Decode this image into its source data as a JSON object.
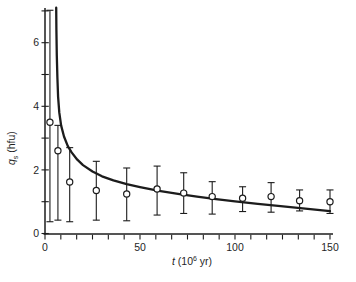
{
  "figure": {
    "background_color": "#ffffff",
    "ink_color": "#1c1c1c",
    "x_axis": {
      "tick_labels": [
        "0",
        "50",
        "100",
        "150"
      ],
      "label_parts": {
        "variable": "t",
        "open": " (10",
        "superscript": "6",
        "close": " yr)"
      }
    },
    "y_axis": {
      "tick_labels": [
        "0",
        "2",
        "4",
        "6"
      ],
      "label_parts": {
        "variable": "q",
        "subscript": "s",
        "rest": " (hfu)"
      }
    }
  },
  "chart_data": {
    "type": "scatter",
    "title": "",
    "xlabel": "t (10^6 yr)",
    "ylabel": "q_s (hfu)",
    "xlim": [
      0,
      154
    ],
    "ylim": [
      0,
      7.1
    ],
    "x_major_ticks": [
      0,
      50,
      100,
      150
    ],
    "x_minor_tick_step": 8.333,
    "y_labeled_ticks": [
      0,
      2,
      4,
      6
    ],
    "y_minor_ticks": [
      1,
      3,
      5,
      7
    ],
    "grid": false,
    "legend": "none",
    "series": [
      {
        "name": "observed mean heat flow with error bars",
        "marker": "open-circle",
        "points": [
          {
            "t": 2.6,
            "q": 3.5,
            "lo": 0.37,
            "hi": 7.02
          },
          {
            "t": 6.8,
            "q": 2.6,
            "lo": 0.42,
            "hi": 3.4
          },
          {
            "t": 13,
            "q": 1.62,
            "lo": 0.37,
            "hi": 2.7
          },
          {
            "t": 27,
            "q": 1.35,
            "lo": 0.42,
            "hi": 2.27
          },
          {
            "t": 43,
            "q": 1.24,
            "lo": 0.4,
            "hi": 2.06
          },
          {
            "t": 59,
            "q": 1.4,
            "lo": 0.58,
            "hi": 2.12
          },
          {
            "t": 73,
            "q": 1.27,
            "lo": 0.63,
            "hi": 1.91
          },
          {
            "t": 88,
            "q": 1.16,
            "lo": 0.61,
            "hi": 1.63
          },
          {
            "t": 104,
            "q": 1.11,
            "lo": 0.69,
            "hi": 1.47
          },
          {
            "t": 119,
            "q": 1.16,
            "lo": 0.67,
            "hi": 1.6
          },
          {
            "t": 134,
            "q": 1.03,
            "lo": 0.71,
            "hi": 1.37
          },
          {
            "t": 150,
            "q": 1.0,
            "lo": 0.63,
            "hi": 1.37
          }
        ]
      },
      {
        "name": "theoretical cooling curve",
        "marker": "none",
        "curve_points": [
          [
            5.9,
            7.1
          ],
          [
            6.0,
            6.4
          ],
          [
            6.2,
            5.6
          ],
          [
            6.5,
            4.9
          ],
          [
            6.9,
            4.3
          ],
          [
            7.5,
            3.8
          ],
          [
            8.5,
            3.4
          ],
          [
            10,
            3.05
          ],
          [
            12,
            2.75
          ],
          [
            14,
            2.55
          ],
          [
            17,
            2.32
          ],
          [
            20,
            2.15
          ],
          [
            25,
            1.95
          ],
          [
            30,
            1.8
          ],
          [
            36,
            1.67
          ],
          [
            43,
            1.55
          ],
          [
            50,
            1.46
          ],
          [
            60,
            1.34
          ],
          [
            70,
            1.25
          ],
          [
            80,
            1.16
          ],
          [
            90,
            1.08
          ],
          [
            100,
            1.01
          ],
          [
            112,
            0.93
          ],
          [
            124,
            0.86
          ],
          [
            137,
            0.78
          ],
          [
            150,
            0.7
          ]
        ]
      }
    ]
  }
}
